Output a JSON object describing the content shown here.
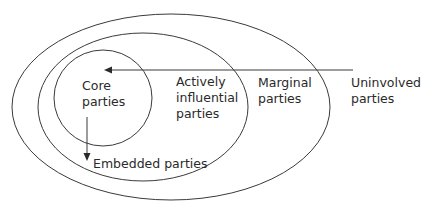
{
  "diagram": {
    "type": "nested-ellipses",
    "stroke_color": "#3a3a3a",
    "text_color": "#2a2a2a",
    "background": "#ffffff",
    "regions": [
      {
        "id": "uninvolved",
        "label_lines": [
          "Uninvolved",
          "parties"
        ]
      },
      {
        "id": "marginal",
        "label_lines": [
          "Marginal",
          "parties"
        ]
      },
      {
        "id": "actively_influential",
        "label_lines": [
          "Actively",
          "influential",
          "parties"
        ]
      },
      {
        "id": "core",
        "label_lines": [
          "Core",
          "parties"
        ]
      }
    ],
    "embedded": {
      "label": "Embedded parties"
    },
    "arrows": [
      {
        "from": "uninvolved",
        "to": "core",
        "direction": "left"
      },
      {
        "from": "core",
        "to": "embedded",
        "direction": "down"
      }
    ]
  }
}
